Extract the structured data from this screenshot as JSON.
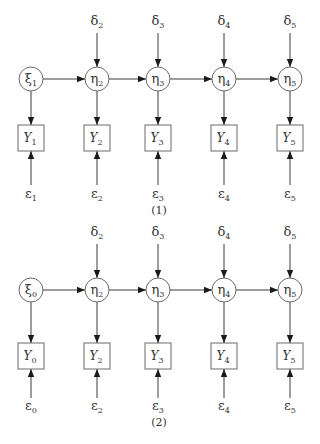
{
  "diagrams": [
    {
      "caption": "(1)",
      "latent": [
        {
          "symbol": "ξ",
          "sub": "1"
        },
        {
          "symbol": "η",
          "sub": "2"
        },
        {
          "symbol": "η",
          "sub": "3"
        },
        {
          "symbol": "η",
          "sub": "4"
        },
        {
          "symbol": "η",
          "sub": "5"
        }
      ],
      "disturbances": [
        null,
        {
          "symbol": "δ",
          "sub": "2"
        },
        {
          "symbol": "δ",
          "sub": "3"
        },
        {
          "symbol": "δ",
          "sub": "4"
        },
        {
          "symbol": "δ",
          "sub": "5"
        }
      ],
      "observed": [
        {
          "symbol": "Y",
          "sub": "1"
        },
        {
          "symbol": "Y",
          "sub": "2"
        },
        {
          "symbol": "Y",
          "sub": "3"
        },
        {
          "symbol": "Y",
          "sub": "4"
        },
        {
          "symbol": "Y",
          "sub": "5"
        }
      ],
      "errors": [
        {
          "symbol": "ε",
          "sub": "1"
        },
        {
          "symbol": "ε",
          "sub": "2"
        },
        {
          "symbol": "ε",
          "sub": "3"
        },
        {
          "symbol": "ε",
          "sub": "4"
        },
        {
          "symbol": "ε",
          "sub": "5"
        }
      ]
    },
    {
      "caption": "(2)",
      "latent": [
        {
          "symbol": "ξ",
          "sub": "0"
        },
        {
          "symbol": "η",
          "sub": "2"
        },
        {
          "symbol": "η",
          "sub": "3"
        },
        {
          "symbol": "η",
          "sub": "4"
        },
        {
          "symbol": "η",
          "sub": "5"
        }
      ],
      "disturbances": [
        null,
        {
          "symbol": "δ",
          "sub": "2"
        },
        {
          "symbol": "δ",
          "sub": "3"
        },
        {
          "symbol": "δ",
          "sub": "4"
        },
        {
          "symbol": "δ",
          "sub": "5"
        }
      ],
      "observed": [
        {
          "symbol": "Y",
          "sub": "0"
        },
        {
          "symbol": "Y",
          "sub": "2"
        },
        {
          "symbol": "Y",
          "sub": "3"
        },
        {
          "symbol": "Y",
          "sub": "4"
        },
        {
          "symbol": "Y",
          "sub": "5"
        }
      ],
      "errors": [
        {
          "symbol": "ε",
          "sub": "0"
        },
        {
          "symbol": "ε",
          "sub": "2"
        },
        {
          "symbol": "ε",
          "sub": "3"
        },
        {
          "symbol": "ε",
          "sub": "4"
        },
        {
          "symbol": "ε",
          "sub": "5"
        }
      ]
    }
  ],
  "colors": {
    "stroke": "#3a3a3a",
    "node_border": "#6a6a6a",
    "text": "#333333",
    "background": "#ffffff"
  }
}
